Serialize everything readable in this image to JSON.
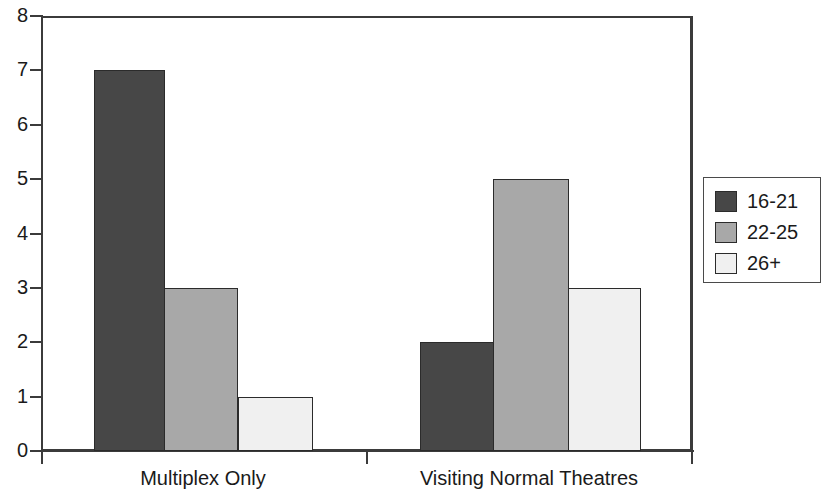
{
  "chart_data": {
    "type": "bar",
    "title": "",
    "subtitle": "",
    "xlabel": "",
    "ylabel": "",
    "categories": [
      "Multiplex Only",
      "Visiting Normal Theatres"
    ],
    "series": [
      {
        "name": "16-21",
        "color": "#474747",
        "values": [
          7,
          2
        ]
      },
      {
        "name": "22-25",
        "color": "#a8a8a8",
        "values": [
          3,
          5
        ]
      },
      {
        "name": "26+",
        "color": "#f0f0f0",
        "values": [
          1,
          3
        ]
      }
    ],
    "ylim": [
      0,
      8
    ],
    "yticks": [
      0,
      1,
      2,
      3,
      4,
      5,
      6,
      7,
      8
    ],
    "ytick_labels": [
      "0",
      "1",
      "2",
      "3",
      "4",
      "5",
      "6",
      "7",
      "8"
    ],
    "grid": false,
    "legend_position": "right",
    "legend_entries": [
      "16-21",
      "22-25",
      "26+"
    ],
    "annotations": []
  },
  "axis": {
    "y_labels": [
      "8",
      "7",
      "6",
      "5",
      "4",
      "3",
      "2",
      "1",
      "0"
    ],
    "x_labels": [
      "Multiplex Only",
      "Visiting Normal Theatres"
    ]
  },
  "legend": {
    "items": [
      {
        "label": "16-21",
        "color": "#474747"
      },
      {
        "label": "22-25",
        "color": "#a8a8a8"
      },
      {
        "label": "26+",
        "color": "#f0f0f0"
      }
    ]
  },
  "colors": {
    "series_dark": "#474747",
    "series_medium": "#a8a8a8",
    "series_light": "#f0f0f0",
    "axis": "#3b3b3b",
    "text": "#1a1a1a",
    "background": "#ffffff"
  }
}
